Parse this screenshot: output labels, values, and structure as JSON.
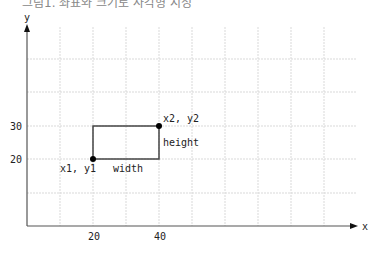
{
  "caption": "그림1. 좌표와 크기로 사각형 지정",
  "axes": {
    "x_label": "x",
    "y_label": "y"
  },
  "ticks": {
    "x": [
      {
        "label": "20"
      },
      {
        "label": "40"
      }
    ],
    "y": [
      {
        "label": "30"
      },
      {
        "label": "20"
      }
    ]
  },
  "rect": {
    "point1_label": "x1, y1",
    "point2_label": "x2, y2",
    "width_label": "width",
    "height_label": "height"
  },
  "colors": {
    "axis": "#555555",
    "grid": "#d8d8d8",
    "rect": "#444444",
    "point": "#000000"
  }
}
